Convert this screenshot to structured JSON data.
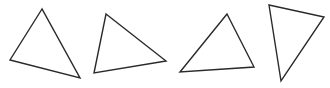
{
  "figure": {
    "width": 330,
    "height": 88,
    "background": "#ffffff",
    "stroke_color": "#2a2a2a",
    "triangles": [
      {
        "id": "triangle-1",
        "points": [
          [
            42,
            9
          ],
          [
            10,
            60
          ],
          [
            80,
            78
          ]
        ]
      },
      {
        "id": "triangle-2",
        "points": [
          [
            106,
            14
          ],
          [
            166,
            61
          ],
          [
            94,
            73
          ]
        ]
      },
      {
        "id": "triangle-3",
        "points": [
          [
            227,
            14
          ],
          [
            180,
            72
          ],
          [
            254,
            67
          ]
        ]
      },
      {
        "id": "triangle-4",
        "points": [
          [
            269,
            5
          ],
          [
            324,
            17
          ],
          [
            281,
            81
          ]
        ]
      }
    ]
  }
}
